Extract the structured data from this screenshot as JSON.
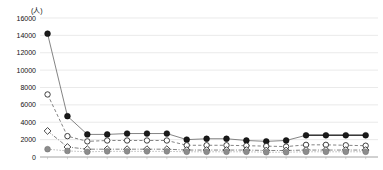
{
  "chart_data": {
    "type": "line",
    "title": "",
    "subtitle": "",
    "xlabel": "",
    "ylabel": "(人)",
    "ylim": [
      0,
      16000
    ],
    "ytick_values": [
      0,
      2000,
      4000,
      6000,
      8000,
      10000,
      12000,
      14000,
      16000
    ],
    "ytick_labels": [
      "0",
      "2000",
      "4000",
      "6000",
      "8000",
      "10000",
      "12000",
      "14000",
      "16000"
    ],
    "grid": true,
    "grid_axis": "y",
    "legend": "none",
    "xtick_labels": [],
    "x": [
      1,
      2,
      3,
      4,
      5,
      6,
      7,
      8,
      9,
      10,
      11,
      12,
      13,
      14,
      15,
      16,
      17
    ],
    "series": [
      {
        "name": "series-black-filled-circle",
        "marker": "filled-circle",
        "color": "#1a1a1a",
        "linestyle": "solid",
        "values": [
          14200,
          4700,
          2600,
          2600,
          2700,
          2700,
          2700,
          2000,
          2100,
          2100,
          1900,
          1800,
          1900,
          2500,
          2500,
          2500,
          2500
        ]
      },
      {
        "name": "series-open-circle",
        "marker": "open-circle",
        "color": "#2b2b2b",
        "linestyle": "dashed",
        "values": [
          7200,
          2400,
          1800,
          1900,
          1900,
          1900,
          1900,
          1350,
          1350,
          1350,
          1300,
          1250,
          1200,
          1400,
          1400,
          1350,
          1300
        ]
      },
      {
        "name": "series-open-diamond",
        "marker": "open-diamond",
        "color": "#333333",
        "linestyle": "dashdot",
        "values": [
          3000,
          1150,
          900,
          900,
          900,
          900,
          900,
          800,
          800,
          800,
          800,
          750,
          750,
          800,
          800,
          800,
          800
        ]
      },
      {
        "name": "series-gray-filled-circle",
        "marker": "filled-circle",
        "color": "#8c8c8c",
        "linestyle": "dotted",
        "values": [
          900,
          700,
          600,
          650,
          650,
          650,
          650,
          600,
          600,
          600,
          600,
          550,
          550,
          600,
          600,
          600,
          600
        ]
      }
    ],
    "emphasis": {
      "note": "last three points of black series drawn with thicker darker connector",
      "from_index": 14,
      "to_index": 17
    }
  }
}
